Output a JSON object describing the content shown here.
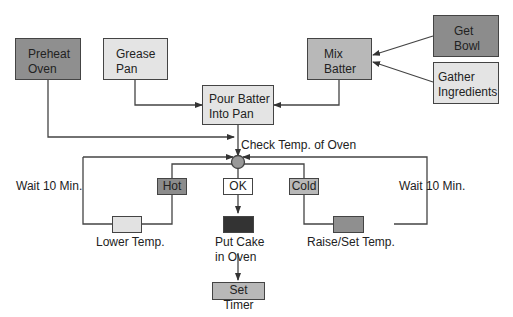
{
  "diagram": {
    "type": "flowchart",
    "colors": {
      "dark": "#8a8a8a",
      "medium": "#b4b4b4",
      "light": "#e2e2e2",
      "black": "#333333",
      "white": "#ffffff",
      "line": "#444444"
    },
    "nodes": {
      "preheat_oven": "Preheat\nOven",
      "preheat_l1": "Preheat",
      "preheat_l2": "Oven",
      "grease_l1": "Grease",
      "grease_l2": "Pan",
      "mix_l1": "Mix",
      "mix_l2": "Batter",
      "get_l1": "Get",
      "get_l2": "Bowl",
      "gather_l1": "Gather",
      "gather_l2": "Ingredients",
      "pour_l1": "Pour Batter",
      "pour_l2": "Into Pan",
      "hot": "Hot",
      "ok": "OK",
      "cold": "Cold",
      "set_timer": "Set Timer"
    },
    "labels": {
      "check_temp": "Check Temp. of Oven",
      "wait_left": "Wait 10 Min.",
      "wait_right": "Wait 10 Min.",
      "lower_temp": "Lower Temp.",
      "raise_temp": "Raise/Set Temp.",
      "put_cake_l1": "Put Cake",
      "put_cake_l2": "in Oven"
    },
    "edges": [
      [
        "Get Bowl",
        "Mix Batter"
      ],
      [
        "Gather Ingredients",
        "Mix Batter"
      ],
      [
        "Mix Batter",
        "Pour Batter Into Pan"
      ],
      [
        "Grease Pan",
        "Pour Batter Into Pan"
      ],
      [
        "Pour Batter Into Pan",
        "Check Temp. of Oven"
      ],
      [
        "Preheat Oven",
        "Check Temp. of Oven"
      ],
      [
        "Check Temp. of Oven",
        "Hot"
      ],
      [
        "Check Temp. of Oven",
        "OK"
      ],
      [
        "Check Temp. of Oven",
        "Cold"
      ],
      [
        "Hot",
        "Lower Temp."
      ],
      [
        "Lower Temp.",
        "Check Temp. of Oven"
      ],
      [
        "Cold",
        "Raise/Set Temp."
      ],
      [
        "Raise/Set Temp.",
        "Check Temp. of Oven"
      ],
      [
        "OK",
        "Put Cake in Oven"
      ],
      [
        "Put Cake in Oven",
        "Set Timer"
      ]
    ]
  }
}
